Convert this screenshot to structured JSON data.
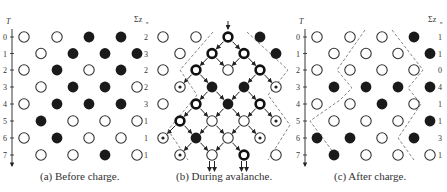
{
  "panels": [
    {
      "id": "a",
      "caption": "(a)  Before charge.",
      "axis_label": "T",
      "sum_label": "Σz_n",
      "row_labels": [
        "0",
        "1",
        "2",
        "3",
        "4",
        "5",
        "6",
        "7"
      ],
      "sums": [
        "2",
        "3",
        "2",
        "2",
        "3",
        "1",
        "1",
        "1"
      ],
      "grid": [
        [
          "open",
          "open",
          "filled",
          "filled"
        ],
        [
          "open",
          "filled",
          "filled",
          "filled"
        ],
        [
          "open",
          "filled",
          "open",
          "filled"
        ],
        [
          "open",
          "filled",
          "filled",
          "open"
        ],
        [
          "open",
          "filled",
          "filled",
          "filled"
        ],
        [
          "filled",
          "open",
          "open",
          "open"
        ],
        [
          "open",
          "filled",
          "open",
          "open"
        ],
        [
          "open",
          "open",
          "filled",
          "open"
        ]
      ]
    },
    {
      "id": "b",
      "caption": "(b)  During avalanche.",
      "grid": [
        [
          "open",
          "open",
          "thick",
          "filled"
        ],
        [
          "open",
          "thick",
          "thick",
          "filled"
        ],
        [
          "open",
          "thick",
          "open",
          "thick"
        ],
        [
          "dot",
          "filled",
          "filled",
          "dot"
        ],
        [
          "open",
          "thick",
          "filled",
          "thick"
        ],
        [
          "thick",
          "open",
          "open",
          "dot"
        ],
        [
          "dot",
          "filled",
          "open",
          "dot"
        ],
        [
          "dot",
          "open",
          "thick",
          "open"
        ]
      ]
    },
    {
      "id": "c",
      "caption": "(c)  After charge.",
      "axis_label": "T",
      "sum_label": "Σz_n",
      "row_labels": [
        "0",
        "1",
        "2",
        "3",
        "4",
        "5",
        "6",
        "7"
      ],
      "sums": [
        "1",
        "1",
        "0",
        "4",
        "1",
        "1",
        "3",
        "1"
      ],
      "grid": [
        [
          "open",
          "open",
          "open",
          "filled"
        ],
        [
          "open",
          "open",
          "open",
          "filled"
        ],
        [
          "open",
          "open",
          "open",
          "open"
        ],
        [
          "filled",
          "filled",
          "filled",
          "filled"
        ],
        [
          "open",
          "open",
          "filled",
          "open"
        ],
        [
          "open",
          "open",
          "open",
          "filled"
        ],
        [
          "filled",
          "filled",
          "open",
          "filled"
        ],
        [
          "filled",
          "open",
          "open",
          "open"
        ]
      ]
    }
  ],
  "legend": {
    "open": "empty site",
    "filled": "occupied site",
    "thick": "toppling site",
    "dot": "receiving site"
  }
}
